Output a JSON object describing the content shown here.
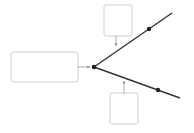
{
  "diagram": {
    "type": "branching-flow",
    "colors": {
      "box_border": "#cfcfcf",
      "box_fill": "#ffffff",
      "main_line": "#333333",
      "connector": "#9a9a9a",
      "node": "#222222",
      "background": "#ffffff"
    },
    "nodes": [
      {
        "id": "source-box",
        "label": "",
        "x": 11,
        "y": 52,
        "w": 67,
        "h": 30
      },
      {
        "id": "top-box",
        "label": "",
        "x": 104,
        "y": 5,
        "w": 28,
        "h": 31
      },
      {
        "id": "bottom-box",
        "label": "",
        "x": 110,
        "y": 93,
        "w": 28,
        "h": 31
      }
    ],
    "junction": {
      "x": 94,
      "y": 67
    },
    "branches": [
      {
        "id": "upper-branch",
        "from": [
          94,
          67
        ],
        "to": [
          172,
          13
        ],
        "marker": [
          149,
          29
        ]
      },
      {
        "id": "lower-branch",
        "from": [
          94,
          67
        ],
        "to": [
          180,
          98
        ],
        "marker": [
          158,
          90
        ]
      }
    ],
    "connectors": [
      {
        "id": "source-to-junction",
        "from": [
          78,
          67
        ],
        "to": [
          91,
          67
        ]
      },
      {
        "id": "top-box-to-upper-branch",
        "from": [
          116,
          36
        ],
        "to": [
          116,
          47
        ]
      },
      {
        "id": "bottom-box-to-lower-branch",
        "from": [
          124,
          93
        ],
        "to": [
          124,
          80
        ]
      }
    ]
  }
}
